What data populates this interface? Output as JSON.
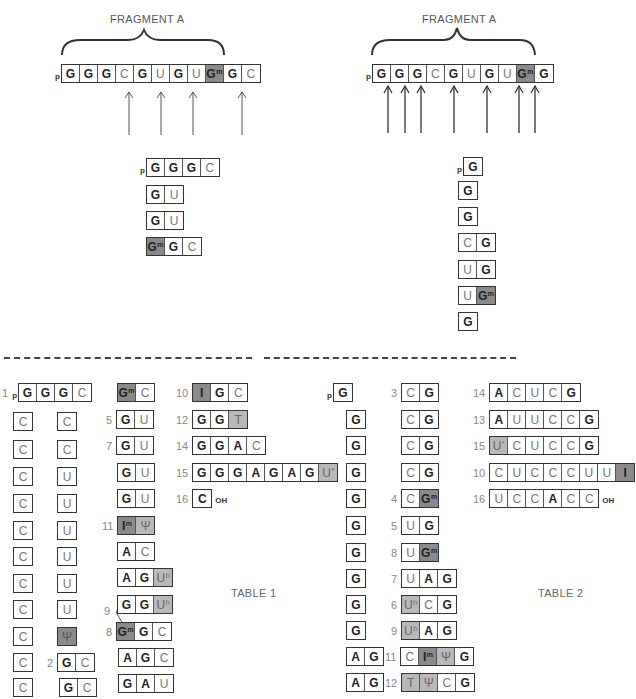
{
  "left_panel": {
    "title": "FRAGMENT A",
    "sequence": [
      "G",
      "G",
      "G",
      "C",
      "G",
      "U",
      "G",
      "U",
      "Gm",
      "G",
      "C"
    ],
    "prefix": "p",
    "cleavage_arrows_after": [
      "C",
      "U",
      "U",
      "C"
    ],
    "products": [
      {
        "prefix": "p",
        "cells": [
          "G",
          "G",
          "G",
          "C"
        ]
      },
      {
        "cells": [
          "G",
          "U"
        ]
      },
      {
        "cells": [
          "G",
          "U"
        ]
      },
      {
        "cells": [
          "Gm",
          "G",
          "C"
        ]
      }
    ]
  },
  "right_panel": {
    "title": "FRAGMENT A",
    "sequence": [
      "G",
      "G",
      "G",
      "C",
      "G",
      "U",
      "G",
      "U",
      "Gm",
      "G"
    ],
    "prefix": "p",
    "arrow_count": 7,
    "products": [
      {
        "prefix": "p",
        "cells": [
          "G"
        ]
      },
      {
        "cells": [
          "G"
        ]
      },
      {
        "cells": [
          "G"
        ]
      },
      {
        "cells": [
          "C",
          "G"
        ]
      },
      {
        "cells": [
          "U",
          "G"
        ]
      },
      {
        "cells": [
          "U",
          "Gm"
        ]
      },
      {
        "cells": [
          "G"
        ]
      }
    ]
  },
  "table1": {
    "label": "TABLE 1",
    "col1": [
      {
        "num": "1",
        "prefix": "p",
        "cells": [
          "G",
          "G",
          "G",
          "C"
        ]
      },
      {
        "cells": [
          "C"
        ]
      },
      {
        "cells": [
          "C"
        ]
      },
      {
        "cells": [
          "C"
        ]
      },
      {
        "cells": [
          "C"
        ]
      },
      {
        "cells": [
          "C"
        ]
      },
      {
        "cells": [
          "C"
        ]
      },
      {
        "cells": [
          "C"
        ]
      },
      {
        "cells": [
          "C"
        ]
      },
      {
        "cells": [
          "C"
        ]
      },
      {
        "cells": [
          "C"
        ]
      },
      {
        "cells": [
          "C"
        ]
      }
    ],
    "col2": [
      {
        "cells": [
          "C"
        ]
      },
      {
        "cells": [
          "C"
        ]
      },
      {
        "cells": [
          "U"
        ]
      },
      {
        "cells": [
          "U"
        ]
      },
      {
        "cells": [
          "U"
        ]
      },
      {
        "cells": [
          "U"
        ]
      },
      {
        "cells": [
          "U"
        ]
      },
      {
        "cells": [
          "U"
        ]
      },
      {
        "cells": [
          "Ψ"
        ]
      },
      {
        "num": "2",
        "cells": [
          "G",
          "C"
        ]
      },
      {
        "cells": [
          "G",
          "C"
        ]
      }
    ],
    "col3": [
      {
        "cells": [
          "Gm",
          "C"
        ]
      },
      {
        "num": "5",
        "cells": [
          "G",
          "U"
        ]
      },
      {
        "num": "7",
        "cells": [
          "G",
          "U"
        ]
      },
      {
        "cells": [
          "G",
          "U"
        ]
      },
      {
        "cells": [
          "G",
          "U"
        ]
      },
      {
        "num": "11",
        "cells": [
          "Im",
          "Ψ"
        ]
      },
      {
        "cells": [
          "A",
          "C"
        ]
      },
      {
        "num": "9",
        "cells": [
          "A",
          "G",
          "Uh"
        ]
      },
      {
        "cells": [
          "G",
          "G",
          "Uh"
        ]
      },
      {
        "num": "8",
        "cells": [
          "Gm",
          "G",
          "C"
        ]
      },
      {
        "cells": [
          "A",
          "G",
          "C"
        ]
      },
      {
        "cells": [
          "G",
          "A",
          "U"
        ]
      }
    ],
    "col4": [
      {
        "num": "10",
        "cells": [
          "I",
          "G",
          "C"
        ]
      },
      {
        "num": "12",
        "cells": [
          "G",
          "G",
          "T"
        ]
      },
      {
        "num": "14",
        "cells": [
          "G",
          "G",
          "A",
          "C"
        ]
      },
      {
        "num": "15",
        "cells": [
          "G",
          "G",
          "G",
          "A",
          "G",
          "A",
          "G",
          "U*"
        ]
      },
      {
        "num": "16",
        "cells": [
          "C"
        ],
        "suffix": "OH"
      }
    ]
  },
  "table2": {
    "label": "TABLE 2",
    "col1": [
      {
        "prefix": "p",
        "cells": [
          "G"
        ]
      },
      {
        "cells": [
          "G"
        ]
      },
      {
        "cells": [
          "G"
        ]
      },
      {
        "cells": [
          "G"
        ]
      },
      {
        "cells": [
          "G"
        ]
      },
      {
        "cells": [
          "G"
        ]
      },
      {
        "cells": [
          "G"
        ]
      },
      {
        "cells": [
          "G"
        ]
      },
      {
        "cells": [
          "G"
        ]
      },
      {
        "cells": [
          "G"
        ]
      },
      {
        "cells": [
          "A",
          "G"
        ]
      },
      {
        "cells": [
          "A",
          "G"
        ]
      }
    ],
    "col2": [
      {
        "num": "3",
        "cells": [
          "C",
          "G"
        ]
      },
      {
        "cells": [
          "C",
          "G"
        ]
      },
      {
        "cells": [
          "C",
          "G"
        ]
      },
      {
        "cells": [
          "C",
          "G"
        ]
      },
      {
        "num": "4",
        "cells": [
          "C",
          "Gm"
        ]
      },
      {
        "num": "5",
        "cells": [
          "U",
          "G"
        ]
      },
      {
        "num": "8",
        "cells": [
          "U",
          "Gm"
        ]
      },
      {
        "num": "7",
        "cells": [
          "U",
          "A",
          "G"
        ]
      },
      {
        "num": "6",
        "cells": [
          "Uh",
          "C",
          "G"
        ]
      },
      {
        "num": "9",
        "cells": [
          "Uh",
          "A",
          "G"
        ]
      },
      {
        "num": "11",
        "cells": [
          "C",
          "Im",
          "Ψ",
          "G"
        ]
      },
      {
        "num": "12",
        "cells": [
          "T",
          "Ψ",
          "C",
          "G"
        ]
      }
    ],
    "col3": [
      {
        "num": "14",
        "cells": [
          "A",
          "C",
          "U",
          "C",
          "G"
        ]
      },
      {
        "num": "13",
        "cells": [
          "A",
          "U",
          "U",
          "C",
          "C",
          "G"
        ]
      },
      {
        "num": "15",
        "cells": [
          "U*",
          "C",
          "U",
          "C",
          "C",
          "G"
        ]
      },
      {
        "num": "10",
        "cells": [
          "C",
          "U",
          "C",
          "C",
          "C",
          "U",
          "U",
          "I"
        ]
      },
      {
        "num": "16",
        "cells": [
          "U",
          "C",
          "C",
          "A",
          "C",
          "C"
        ],
        "suffix": "OH"
      }
    ]
  },
  "colors": {
    "dark_shade": "#8a8a8a",
    "light_shade": "#b9b9b9",
    "line": "#333333"
  }
}
